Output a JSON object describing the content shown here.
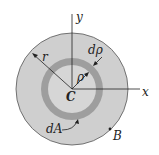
{
  "diagram": {
    "colors": {
      "background": "#ffffff",
      "outer_disk": "#cfcfcf",
      "ring": "#9e9e9e",
      "inner_disk": "#d6d6d6",
      "stroke": "#222222"
    },
    "labels": {
      "y_axis": "y",
      "x_axis": "x",
      "radius": "r",
      "ring_width": "dρ",
      "ring_radius": "ρ",
      "center": "C",
      "area_element": "dA",
      "boundary": "B"
    }
  }
}
